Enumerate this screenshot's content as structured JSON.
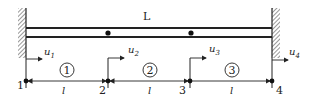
{
  "diagram": {
    "beam_label": "L",
    "colors": {
      "stroke": "#222222",
      "hatch_bg": "#ffffff"
    },
    "nodes": [
      {
        "id": "1",
        "x": 26,
        "disp_base": "u",
        "disp_sub": "1"
      },
      {
        "id": "2",
        "x": 108,
        "disp_base": "u",
        "disp_sub": "2"
      },
      {
        "id": "3",
        "x": 190,
        "disp_base": "u",
        "disp_sub": "3"
      },
      {
        "id": "4",
        "x": 272,
        "disp_base": "u",
        "disp_sub": "4"
      }
    ],
    "elements": [
      {
        "id": "1",
        "length_label": "l"
      },
      {
        "id": "2",
        "length_label": "l"
      },
      {
        "id": "3",
        "length_label": "l"
      }
    ]
  }
}
